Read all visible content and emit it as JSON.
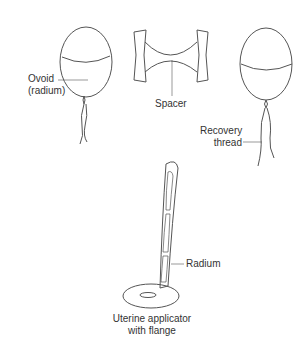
{
  "labels": {
    "ovoid_line1": "Ovoid",
    "ovoid_line2": "(radium)",
    "spacer": "Spacer",
    "recovery_line1": "Recovery",
    "recovery_line2": "thread",
    "radium": "Radium",
    "uterine_line1": "Uterine applicator",
    "uterine_line2": "with flange"
  },
  "colors": {
    "stroke": "#555555",
    "text": "#333333",
    "background": "#ffffff"
  }
}
